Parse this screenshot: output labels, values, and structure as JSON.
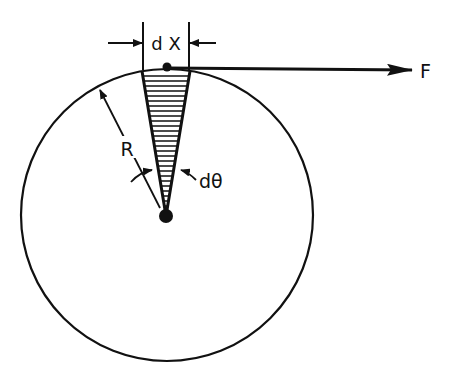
{
  "diagram": {
    "labels": {
      "dx": "d X",
      "force": "F",
      "radius": "R",
      "dtheta": "dθ"
    },
    "circle": {
      "cx": 167,
      "cy": 215,
      "r": 146
    },
    "wedge": {
      "top_left_x": 142,
      "top_right_x": 190,
      "top_y": 71,
      "apex_x": 166,
      "apex_y": 216,
      "hatch_spacing": 5
    },
    "colors": {
      "ink": "#111111",
      "background": "#ffffff"
    }
  }
}
